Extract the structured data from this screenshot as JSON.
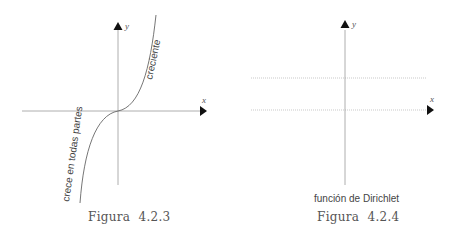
{
  "figures": [
    {
      "id": "4.2.3",
      "title": "Figura  4.2.3",
      "x_axis_label": "x",
      "y_axis_label": "y",
      "curve_labels": {
        "upper": "creciente",
        "lower": "crece en todas partes"
      }
    },
    {
      "id": "4.2.4",
      "title": "Figura  4.2.4",
      "x_axis_label": "x",
      "y_axis_label": "y",
      "caption": "función de Dirichlet"
    }
  ],
  "colors": {
    "axis": "#888888",
    "curve": "#666666",
    "dotted": "#bbbbbb",
    "arrow": "#111111"
  }
}
